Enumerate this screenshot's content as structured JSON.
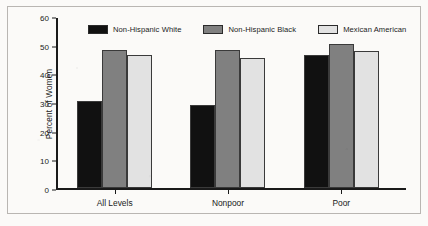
{
  "chart_data": {
    "type": "bar",
    "title": "",
    "subtitle": "",
    "xlabel": "",
    "ylabel": "Percent of Women",
    "categories": [
      "All Levels",
      "Nonpoor",
      "Poor"
    ],
    "series": [
      {
        "name": "Non-Hispanic White",
        "color": "#111111",
        "values": [
          30.5,
          28.8,
          46.3
        ]
      },
      {
        "name": "Non-Hispanic Black",
        "color": "#808080",
        "values": [
          48.2,
          48.2,
          50.1
        ]
      },
      {
        "name": "Mexican American",
        "color": "#e2e2e2",
        "values": [
          46.3,
          45.5,
          47.8
        ]
      }
    ],
    "ylim": [
      0,
      60
    ],
    "ytick_values": [
      0,
      10,
      20,
      30,
      40,
      50,
      60
    ],
    "ytick_labels": [
      "0",
      "10",
      "20",
      "30",
      "40",
      "50",
      "60"
    ],
    "grid": false,
    "legend_position": "top-center",
    "bar_orientation": "vertical",
    "grouping": "clustered"
  },
  "legend": {
    "items": [
      {
        "label": "Non-Hispanic White",
        "color": "#111111"
      },
      {
        "label": "Non-Hispanic Black",
        "color": "#808080"
      },
      {
        "label": "Mexican American",
        "color": "#e2e2e2"
      }
    ]
  },
  "axes": {
    "y_title": "Percent of Women",
    "y_ticks": [
      "60",
      "50",
      "40",
      "30",
      "20",
      "10",
      "0"
    ],
    "x_ticks": [
      "All Levels",
      "Nonpoor",
      "Poor"
    ]
  },
  "style": {
    "frame_color": "#b9b6b2",
    "axis_color": "#1a1a1a",
    "background": "#fbfaf8"
  }
}
